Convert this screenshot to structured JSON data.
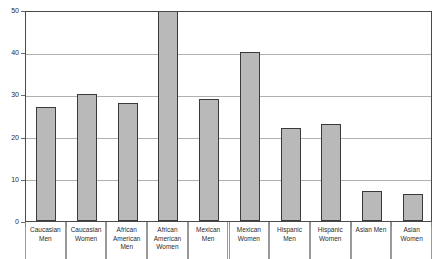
{
  "chart_data": {
    "type": "bar",
    "title": "",
    "subtitle": "",
    "xlabel": "",
    "ylabel": "",
    "ylim": [
      0,
      50
    ],
    "yticks": [
      0,
      10,
      20,
      30,
      40,
      50
    ],
    "ytick_labels": [
      "0",
      "10",
      "20",
      "30",
      "40",
      "50"
    ],
    "grid": true,
    "legend": "none",
    "bar_fill_color": "#b9b9b9",
    "bar_border_color": "#3a3a3a",
    "gridline_color": "#b0b0b0",
    "frame_color": "#4a4a4a",
    "categories": [
      "Caucasian Men",
      "Caucasian Women",
      "African American Men",
      "African American Women",
      "Mexican Men",
      "Mexican Women",
      "Hispanic Men",
      "Hispanic Women",
      "Asian Men",
      "Asian Women"
    ],
    "values": [
      27,
      30,
      28,
      50,
      29,
      40,
      22,
      23,
      7,
      6.5
    ]
  }
}
